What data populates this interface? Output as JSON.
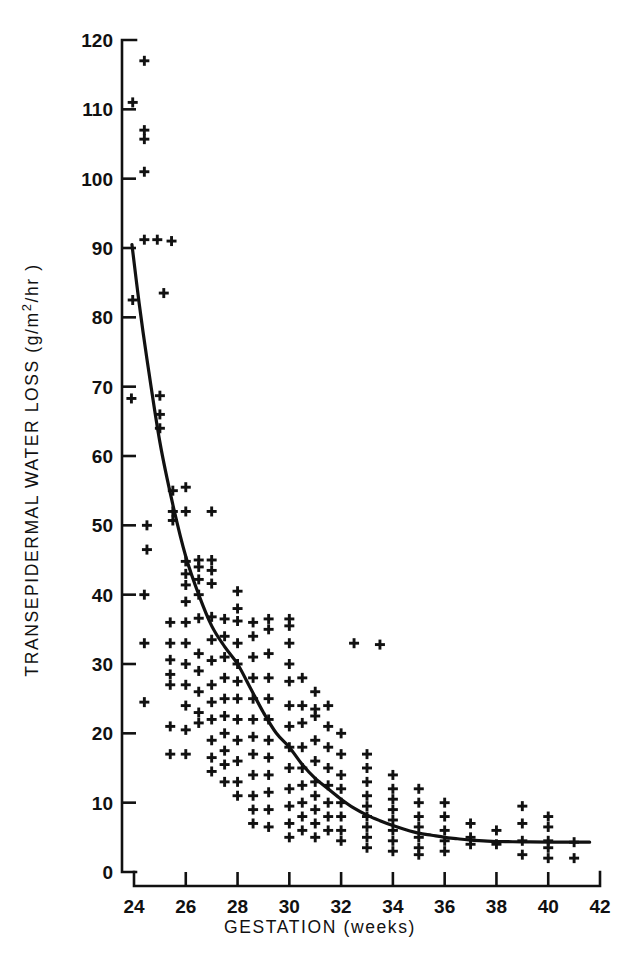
{
  "chart_data": {
    "type": "scatter",
    "title": "",
    "subtitle": "",
    "xlabel": "GESTATION (weeks)",
    "ylabel": "TRANSEPIDERMAL WATER LOSS (g/m2/hr)",
    "ylabel_parts": {
      "prefix": "TRANSEPIDERMAL  WATER  LOSS  (g/m",
      "superscript": "2",
      "suffix": "/hr )"
    },
    "xlim": [
      23.6,
      42.3
    ],
    "ylim": [
      0,
      120
    ],
    "xticks": [
      24,
      26,
      28,
      30,
      32,
      34,
      36,
      38,
      40,
      42
    ],
    "yticks": [
      0,
      10,
      20,
      30,
      40,
      50,
      60,
      70,
      80,
      90,
      100,
      110,
      120
    ],
    "xtick_labels": [
      "24",
      "26",
      "28",
      "30",
      "32",
      "34",
      "36",
      "38",
      "40",
      "42"
    ],
    "ytick_labels": [
      "0",
      "10",
      "20",
      "30",
      "40",
      "50",
      "60",
      "70",
      "80",
      "90",
      "100",
      "110",
      "120"
    ],
    "grid": false,
    "legend": null,
    "marker": "plus",
    "marker_color": "#111111",
    "curve_color": "#111111",
    "axis_color": "#111111",
    "series": [
      {
        "name": "Transepidermal water loss measurements",
        "marker": "plus",
        "points": [
          [
            24.4,
            117.0
          ],
          [
            23.95,
            111.0
          ],
          [
            24.4,
            107.0
          ],
          [
            24.4,
            105.7
          ],
          [
            24.4,
            101.0
          ],
          [
            24.4,
            91.2
          ],
          [
            24.9,
            91.2
          ],
          [
            25.45,
            91.0
          ],
          [
            25.15,
            83.5
          ],
          [
            23.95,
            82.5
          ],
          [
            23.9,
            68.3
          ],
          [
            25.0,
            68.7
          ],
          [
            25.0,
            66.0
          ],
          [
            25.0,
            64.0
          ],
          [
            24.5,
            50.0
          ],
          [
            24.5,
            46.5
          ],
          [
            25.5,
            55.0
          ],
          [
            25.5,
            52.0
          ],
          [
            25.5,
            50.7
          ],
          [
            26.0,
            55.5
          ],
          [
            26.0,
            52.0
          ],
          [
            27.0,
            52.0
          ],
          [
            24.4,
            40.0
          ],
          [
            24.4,
            33.0
          ],
          [
            24.4,
            24.5
          ],
          [
            25.4,
            36.0
          ],
          [
            25.4,
            33.0
          ],
          [
            25.4,
            30.6
          ],
          [
            25.4,
            28.5
          ],
          [
            25.4,
            27.0
          ],
          [
            25.4,
            21.0
          ],
          [
            25.4,
            17.0
          ],
          [
            26.0,
            44.8
          ],
          [
            26.0,
            43.0
          ],
          [
            26.0,
            41.4
          ],
          [
            26.0,
            39.0
          ],
          [
            26.0,
            36.0
          ],
          [
            26.0,
            33.0
          ],
          [
            26.0,
            30.0
          ],
          [
            26.0,
            27.0
          ],
          [
            26.0,
            24.0
          ],
          [
            26.0,
            20.5
          ],
          [
            26.0,
            17.0
          ],
          [
            26.5,
            45.0
          ],
          [
            26.5,
            44.0
          ],
          [
            26.5,
            42.2
          ],
          [
            26.5,
            40.0
          ],
          [
            26.5,
            36.6
          ],
          [
            26.5,
            31.5
          ],
          [
            26.5,
            29.0
          ],
          [
            26.5,
            26.0
          ],
          [
            26.5,
            23.0
          ],
          [
            26.5,
            21.5
          ],
          [
            27.0,
            45.0
          ],
          [
            27.0,
            43.5
          ],
          [
            27.0,
            41.6
          ],
          [
            27.0,
            36.8
          ],
          [
            27.0,
            33.5
          ],
          [
            27.0,
            30.5
          ],
          [
            27.0,
            27.0
          ],
          [
            27.0,
            24.5
          ],
          [
            27.0,
            22.0
          ],
          [
            27.0,
            19.0
          ],
          [
            27.0,
            16.5
          ],
          [
            27.0,
            14.5
          ],
          [
            27.5,
            36.5
          ],
          [
            27.5,
            34.0
          ],
          [
            27.5,
            31.0
          ],
          [
            27.5,
            28.0
          ],
          [
            27.5,
            25.0
          ],
          [
            27.5,
            22.5
          ],
          [
            27.5,
            20.0
          ],
          [
            27.5,
            17.5
          ],
          [
            27.5,
            15.5
          ],
          [
            27.5,
            13.0
          ],
          [
            28.0,
            40.5
          ],
          [
            28.0,
            38.0
          ],
          [
            28.0,
            36.2
          ],
          [
            28.0,
            33.0
          ],
          [
            28.0,
            30.0
          ],
          [
            28.0,
            27.5
          ],
          [
            28.0,
            25.0
          ],
          [
            28.0,
            22.0
          ],
          [
            28.0,
            19.0
          ],
          [
            28.0,
            16.0
          ],
          [
            28.0,
            13.0
          ],
          [
            28.0,
            11.0
          ],
          [
            28.6,
            36.0
          ],
          [
            28.6,
            34.0
          ],
          [
            28.6,
            31.0
          ],
          [
            28.6,
            28.0
          ],
          [
            28.6,
            25.0
          ],
          [
            28.6,
            22.0
          ],
          [
            28.6,
            19.5
          ],
          [
            28.6,
            17.0
          ],
          [
            28.6,
            14.0
          ],
          [
            28.6,
            11.0
          ],
          [
            28.6,
            9.0
          ],
          [
            28.6,
            7.0
          ],
          [
            29.2,
            36.5
          ],
          [
            29.2,
            35.0
          ],
          [
            29.2,
            31.5
          ],
          [
            29.2,
            28.0
          ],
          [
            29.2,
            25.0
          ],
          [
            29.2,
            22.0
          ],
          [
            29.2,
            19.0
          ],
          [
            29.2,
            16.5
          ],
          [
            29.2,
            14.0
          ],
          [
            29.2,
            11.5
          ],
          [
            29.2,
            9.0
          ],
          [
            29.2,
            6.5
          ],
          [
            30.0,
            36.5
          ],
          [
            30.0,
            35.5
          ],
          [
            30.0,
            33.0
          ],
          [
            30.0,
            30.0
          ],
          [
            30.0,
            27.5
          ],
          [
            30.0,
            24.0
          ],
          [
            30.0,
            21.0
          ],
          [
            30.0,
            18.0
          ],
          [
            30.0,
            15.0
          ],
          [
            30.0,
            12.0
          ],
          [
            30.0,
            9.5
          ],
          [
            30.0,
            7.0
          ],
          [
            30.0,
            5.0
          ],
          [
            30.5,
            28.0
          ],
          [
            30.5,
            24.0
          ],
          [
            30.5,
            21.5
          ],
          [
            30.5,
            18.0
          ],
          [
            30.5,
            15.0
          ],
          [
            30.5,
            12.5
          ],
          [
            30.5,
            10.0
          ],
          [
            30.5,
            8.0
          ],
          [
            30.5,
            6.0
          ],
          [
            31.0,
            26.0
          ],
          [
            31.0,
            23.5
          ],
          [
            31.0,
            22.5
          ],
          [
            31.0,
            19.0
          ],
          [
            31.0,
            16.0
          ],
          [
            31.0,
            13.0
          ],
          [
            31.0,
            11.0
          ],
          [
            31.0,
            9.0
          ],
          [
            31.0,
            7.0
          ],
          [
            31.0,
            5.0
          ],
          [
            31.5,
            24.0
          ],
          [
            31.5,
            21.0
          ],
          [
            31.5,
            18.0
          ],
          [
            31.5,
            15.0
          ],
          [
            31.5,
            12.5
          ],
          [
            31.5,
            10.0
          ],
          [
            31.5,
            8.0
          ],
          [
            31.5,
            6.0
          ],
          [
            32.5,
            33.0
          ],
          [
            33.5,
            32.8
          ],
          [
            32.0,
            20.0
          ],
          [
            32.0,
            17.0
          ],
          [
            32.0,
            14.0
          ],
          [
            32.0,
            12.0
          ],
          [
            32.0,
            10.0
          ],
          [
            32.0,
            8.0
          ],
          [
            32.0,
            6.0
          ],
          [
            32.0,
            4.5
          ],
          [
            33.0,
            17.0
          ],
          [
            33.0,
            15.0
          ],
          [
            33.0,
            13.0
          ],
          [
            33.0,
            11.0
          ],
          [
            33.0,
            9.5
          ],
          [
            33.0,
            8.0
          ],
          [
            33.0,
            6.5
          ],
          [
            33.0,
            5.0
          ],
          [
            33.0,
            3.5
          ],
          [
            34.0,
            14.0
          ],
          [
            34.0,
            12.0
          ],
          [
            34.0,
            10.5
          ],
          [
            34.0,
            9.0
          ],
          [
            34.0,
            7.5
          ],
          [
            34.0,
            6.0
          ],
          [
            34.0,
            4.5
          ],
          [
            34.0,
            3.0
          ],
          [
            35.0,
            12.0
          ],
          [
            35.0,
            10.0
          ],
          [
            35.0,
            8.0
          ],
          [
            35.0,
            6.5
          ],
          [
            35.0,
            5.0
          ],
          [
            35.0,
            3.5
          ],
          [
            35.0,
            2.5
          ],
          [
            36.0,
            10.0
          ],
          [
            36.0,
            8.0
          ],
          [
            36.0,
            6.0
          ],
          [
            36.0,
            4.5
          ],
          [
            36.0,
            3.0
          ],
          [
            37.0,
            7.0
          ],
          [
            37.0,
            5.0
          ],
          [
            37.0,
            4.0
          ],
          [
            38.0,
            6.0
          ],
          [
            38.0,
            4.0
          ],
          [
            39.0,
            9.5
          ],
          [
            39.0,
            7.0
          ],
          [
            39.0,
            4.5
          ],
          [
            39.0,
            2.5
          ],
          [
            40.0,
            8.0
          ],
          [
            40.0,
            6.5
          ],
          [
            40.0,
            4.5
          ],
          [
            40.0,
            3.5
          ],
          [
            40.0,
            2.0
          ],
          [
            41.0,
            4.3
          ],
          [
            41.0,
            2.0
          ]
        ]
      }
    ],
    "fit_curve": {
      "name": "fitted exponential decay curve",
      "points": [
        [
          23.92,
          90.5
        ],
        [
          24.2,
          82.0
        ],
        [
          24.5,
          74.0
        ],
        [
          25.0,
          62.0
        ],
        [
          25.5,
          53.0
        ],
        [
          26.0,
          45.5
        ],
        [
          26.5,
          40.0
        ],
        [
          27.0,
          35.5
        ],
        [
          27.5,
          32.5
        ],
        [
          28.0,
          30.0
        ],
        [
          28.5,
          26.5
        ],
        [
          29.0,
          23.0
        ],
        [
          29.5,
          20.0
        ],
        [
          30.0,
          18.0
        ],
        [
          30.5,
          15.5
        ],
        [
          31.0,
          13.5
        ],
        [
          31.5,
          12.0
        ],
        [
          32.0,
          10.5
        ],
        [
          32.5,
          9.2
        ],
        [
          33.0,
          8.2
        ],
        [
          33.5,
          7.4
        ],
        [
          34.0,
          6.7
        ],
        [
          34.5,
          6.1
        ],
        [
          35.0,
          5.6
        ],
        [
          35.5,
          5.3
        ],
        [
          36.0,
          5.0
        ],
        [
          36.5,
          4.8
        ],
        [
          37.0,
          4.6
        ],
        [
          37.5,
          4.5
        ],
        [
          38.0,
          4.4
        ],
        [
          39.0,
          4.35
        ],
        [
          40.0,
          4.3
        ],
        [
          41.0,
          4.3
        ],
        [
          41.6,
          4.3
        ]
      ]
    }
  }
}
